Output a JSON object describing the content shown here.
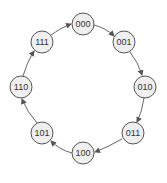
{
  "diagram": {
    "type": "state-diagram",
    "nodes": [
      {
        "id": "n0",
        "label": "000",
        "x": 83,
        "y": 24
      },
      {
        "id": "n1",
        "label": "001",
        "x": 124,
        "y": 42
      },
      {
        "id": "n2",
        "label": "010",
        "x": 145,
        "y": 87
      },
      {
        "id": "n3",
        "label": "011",
        "x": 133,
        "y": 133
      },
      {
        "id": "n4",
        "label": "100",
        "x": 83,
        "y": 153
      },
      {
        "id": "n5",
        "label": "101",
        "x": 42,
        "y": 133
      },
      {
        "id": "n6",
        "label": "110",
        "x": 21,
        "y": 87
      },
      {
        "id": "n7",
        "label": "111",
        "x": 42,
        "y": 42
      }
    ],
    "edges": [
      {
        "from": "000",
        "to": "001"
      },
      {
        "from": "001",
        "to": "010"
      },
      {
        "from": "010",
        "to": "011"
      },
      {
        "from": "011",
        "to": "100"
      },
      {
        "from": "100",
        "to": "101"
      },
      {
        "from": "101",
        "to": "110"
      },
      {
        "from": "110",
        "to": "111"
      },
      {
        "from": "111",
        "to": "000"
      }
    ],
    "colors": {
      "node_fill": "#efefef",
      "stroke": "#555555",
      "text": "#333333"
    }
  }
}
